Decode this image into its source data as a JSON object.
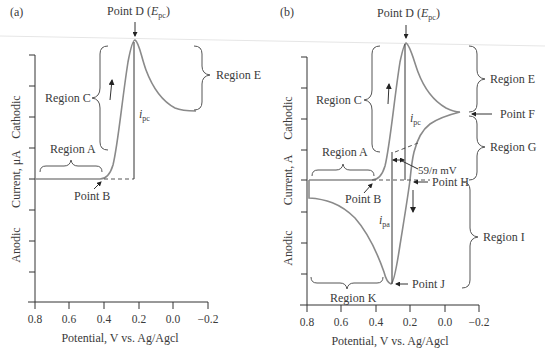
{
  "figure": {
    "panel_a": {
      "label": "(a)",
      "point_d": "Point D (",
      "point_d_sym": "E",
      "point_d_sub": "pc",
      "point_d_close": ")",
      "region_a": "Region A",
      "region_c": "Region C",
      "region_e": "Region E",
      "point_b": "Point B",
      "ipc_sym": "i",
      "ipc_sub": "pc",
      "ylabel_cathodic": "Cathodic",
      "ylabel_current": "Current, μA",
      "ylabel_anodic": "Anodic",
      "xlabel": "Potential, V vs. Ag/Agcl",
      "xticks": [
        "0.8",
        "0.6",
        "0.4",
        "0.2",
        "0.0",
        "−0.2"
      ]
    },
    "panel_b": {
      "label": "(b)",
      "point_d": "Point D (",
      "point_d_sym": "E",
      "point_d_sub": "pc",
      "point_d_close": ")",
      "region_a": "Region A",
      "region_c": "Region C",
      "region_e": "Region E",
      "region_g": "Region G",
      "region_i": "Region I",
      "region_k": "Region K",
      "point_b": "Point B",
      "point_f": "Point F",
      "point_h": "Point H",
      "point_j": "Point J",
      "ipc_sym": "i",
      "ipc_sub": "pc",
      "ipa_sym": "i",
      "ipa_sub": "pa",
      "separation": "59/n mV",
      "separation_pre": "59/",
      "separation_n": "n",
      "separation_post": " mV",
      "ylabel_cathodic": "Cathodic",
      "ylabel_current": "Current,   A",
      "ylabel_anodic": "Anodic",
      "xlabel": "Potential, V vs. Ag/Agcl",
      "xticks": [
        "0.8",
        "0.6",
        "0.4",
        "0.2",
        "0.0",
        "−0.2"
      ]
    },
    "colors": {
      "curve": "#8a8a8a",
      "axis": "#333333",
      "text": "#3a3a3a"
    }
  }
}
